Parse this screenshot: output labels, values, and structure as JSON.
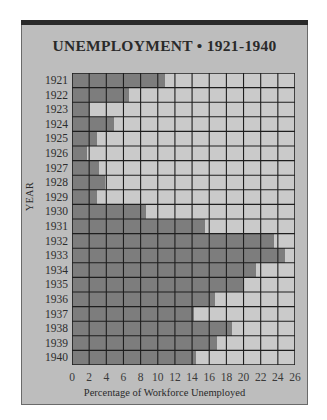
{
  "chart_data": {
    "type": "bar",
    "orientation": "horizontal",
    "title": "UNEMPLOYMENT • 1921-1940",
    "xlabel": "Percentage of Workforce Unemployed",
    "ylabel": "YEAR",
    "xlim": [
      0,
      26
    ],
    "xticks": [
      0,
      2,
      4,
      6,
      8,
      10,
      12,
      14,
      16,
      18,
      20,
      22,
      24,
      26
    ],
    "grid": true,
    "legend": null,
    "categories": [
      "1921",
      "1922",
      "1923",
      "1924",
      "1925",
      "1926",
      "1927",
      "1928",
      "1929",
      "1930",
      "1931",
      "1932",
      "1933",
      "1934",
      "1935",
      "1936",
      "1937",
      "1938",
      "1939",
      "1940"
    ],
    "values": [
      10.9,
      6.6,
      2.1,
      4.9,
      2.9,
      1.8,
      3.1,
      3.9,
      2.9,
      8.6,
      15.5,
      23.5,
      24.8,
      21.5,
      19.9,
      16.7,
      14.2,
      18.7,
      16.9,
      14.5
    ]
  },
  "colors": {
    "panel_background": "#bdbdbd",
    "bar_fill": "#7d7d7d",
    "empty_cell": "#cacaca",
    "grid_line": "#1e1e1e",
    "title_text": "#2a2a2a",
    "top_band": "#2a2a2a"
  }
}
